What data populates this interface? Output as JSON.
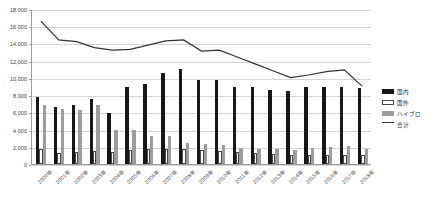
{
  "chart_data": {
    "type": "bar",
    "title": "",
    "xlabel": "",
    "ylabel": "",
    "ylim": [
      0,
      18000
    ],
    "ytick_step": 2000,
    "grid": true,
    "legend_position": "right",
    "categories": [
      "2000年",
      "2001年",
      "2002年",
      "2003年",
      "2004年",
      "2005年",
      "2006年",
      "2007年",
      "2008年",
      "2009年",
      "2010年",
      "2011年",
      "2012年",
      "2013年",
      "2014年",
      "2015年",
      "2016年",
      "2017年",
      "2018年"
    ],
    "ytick_labels": [
      "0",
      "2,000",
      "4,000",
      "6,000",
      "8,000",
      "10,000",
      "12,000",
      "14,000",
      "16,000",
      "18,000"
    ],
    "series": [
      {
        "name": "国内",
        "type": "bar",
        "color": "#171717",
        "values": [
          7800,
          6600,
          6900,
          7600,
          5900,
          9000,
          9300,
          10600,
          11000,
          9700,
          9800,
          9000,
          8900,
          8600,
          8500,
          8900,
          9000,
          9000,
          8800
        ]
      },
      {
        "name": "国外",
        "type": "bar",
        "color": "#ffffff",
        "values": [
          1800,
          1300,
          1400,
          1500,
          1400,
          1600,
          1700,
          1800,
          1700,
          1600,
          1500,
          1400,
          1300,
          1200,
          1100,
          1100,
          1100,
          1100,
          1000
        ]
      },
      {
        "name": "ハイブロ",
        "type": "bar",
        "color": "#9d9d9d",
        "values": [
          6900,
          6400,
          6300,
          6800,
          4000,
          3900,
          3300,
          3300,
          2400,
          2300,
          2200,
          1900,
          1800,
          1700,
          1600,
          1900,
          2000,
          2100,
          1700
        ]
      },
      {
        "name": "合計",
        "type": "line",
        "color": "#333333",
        "values": [
          16700,
          14500,
          14300,
          13600,
          13300,
          13400,
          13900,
          14400,
          14500,
          13200,
          13300,
          12500,
          11700,
          10900,
          10100,
          10400,
          10800,
          11000,
          9100
        ]
      }
    ]
  },
  "legend": {
    "items": [
      {
        "label": "国内",
        "swatch": "domestic"
      },
      {
        "label": "国外",
        "swatch": "overseas"
      },
      {
        "label": "ハイブロ",
        "swatch": "hybrid"
      },
      {
        "label": "合計",
        "swatch": "total"
      }
    ]
  }
}
